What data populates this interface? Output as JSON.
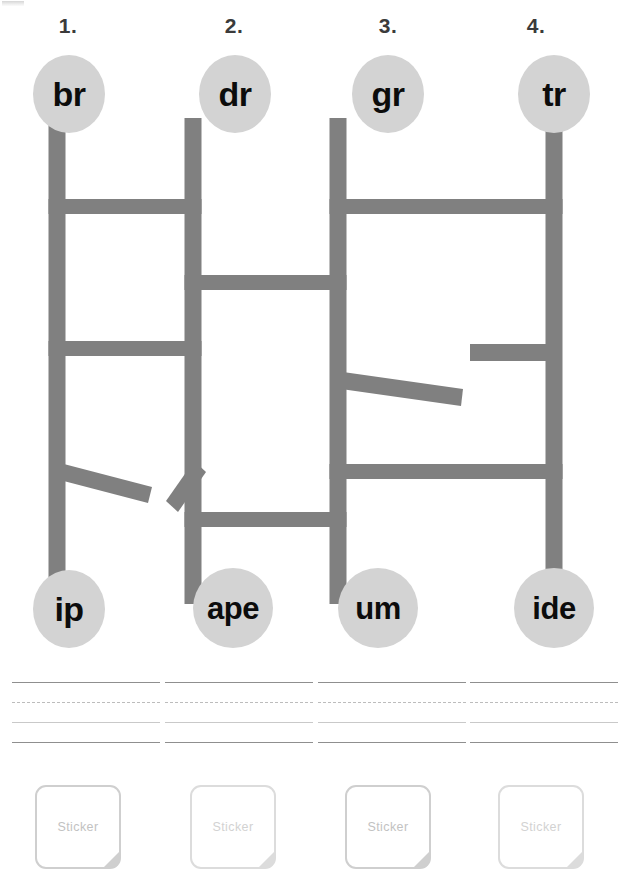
{
  "page": {
    "kind": "phonics-blend-maze-worksheet",
    "background": "#ffffff",
    "maze_color": "#808080",
    "bubble_color": "#d3d3d3",
    "bubble_text_color": "#0c0c0c",
    "line_dark_color": "#8f8f8f",
    "line_light_color": "#c9c9c9",
    "sticker_border_color": "#cfcfcf"
  },
  "columns": [
    {
      "number": "1.",
      "onset": "br",
      "rime": "ip",
      "num_x": 38,
      "top_x": 33,
      "bot_x": 33,
      "lines_x": 12,
      "sticker_x": 35,
      "sticker_dim": false
    },
    {
      "number": "2.",
      "onset": "dr",
      "rime": "ape",
      "num_x": 204,
      "top_x": 199,
      "bot_x": 195,
      "lines_x": 165,
      "sticker_x": 190,
      "sticker_dim": true
    },
    {
      "number": "3.",
      "onset": "gr",
      "rime": "um",
      "num_x": 358,
      "top_x": 352,
      "bot_x": 348,
      "lines_x": 318,
      "sticker_x": 345,
      "sticker_dim": false
    },
    {
      "number": "4.",
      "onset": "tr",
      "rime": "ide",
      "num_x": 506,
      "top_x": 502,
      "bot_x": 498,
      "lines_x": 470,
      "sticker_x": 498,
      "sticker_dim": true
    }
  ],
  "geometry": {
    "top_bubble_y": 55,
    "bottom_bubble_y": 570,
    "lines_y": 682,
    "sticker_y": 785,
    "stem_cx": [
      57,
      193,
      338,
      554
    ]
  },
  "maze": {
    "stroke_width": 17,
    "columns_x": [
      57,
      193,
      338,
      554
    ],
    "vertical_top_y": 120,
    "vertical_bottom_y": 600,
    "rungs": [
      {
        "from_col": 0,
        "to_col": 1,
        "y": 206
      },
      {
        "from_col": 2,
        "to_col": 3,
        "y": 206
      },
      {
        "from_col": 1,
        "to_col": 2,
        "y": 282
      },
      {
        "from_col": 0,
        "to_col": 1,
        "y": 348
      },
      {
        "from_col": 2,
        "to_col": 3,
        "y": 471
      },
      {
        "from_col": 1,
        "to_col": 2,
        "y": 519
      }
    ],
    "stubs": [
      {
        "col": 3,
        "dir": "left",
        "y": 353,
        "length": 78
      }
    ],
    "diagonals": [
      {
        "x1": 57,
        "y1": 470,
        "x2": 150,
        "y2": 500
      },
      {
        "x1": 170,
        "y1": 502,
        "x2": 193,
        "y2": 468
      },
      {
        "x1": 338,
        "y1": 383,
        "x2": 463,
        "y2": 404
      }
    ]
  },
  "writing_lines": {
    "width": 148,
    "rows": [
      {
        "style": "solid-dark",
        "offset": 0
      },
      {
        "style": "dashed",
        "offset": 20
      },
      {
        "style": "solid-light",
        "offset": 40
      },
      {
        "style": "solid-dark",
        "offset": 60
      }
    ]
  },
  "sticker": {
    "label": "Sticker"
  }
}
